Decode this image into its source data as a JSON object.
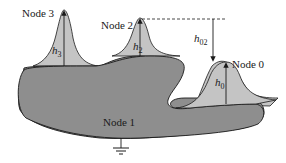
{
  "diagram": {
    "type": "charge-sharing nodes diagram",
    "nodes": [
      {
        "id": "node3",
        "label": "Node 3",
        "height_var": "h",
        "height_sub": "3"
      },
      {
        "id": "node2",
        "label": "Node 2",
        "height_var": "h",
        "height_sub": "2"
      },
      {
        "id": "node0",
        "label": "Node 0",
        "height_var": "h",
        "height_sub": "0"
      },
      {
        "id": "node1",
        "label": "Node 1"
      }
    ],
    "difference": {
      "var": "h",
      "sub": "02"
    },
    "colors": {
      "substrate_fill": "#8e8e8e",
      "bump_fill": "#c4c4c4",
      "outline": "#1a1a1a",
      "background": "#ffffff"
    }
  }
}
